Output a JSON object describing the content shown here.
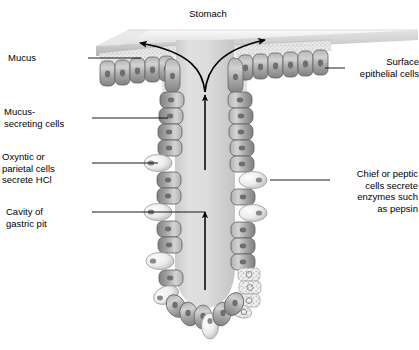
{
  "figure": {
    "name": "gastric-pit-cross-section",
    "title": "Stomach",
    "background_color": "#ffffff",
    "ink_color": "#000000"
  },
  "labels": {
    "stomach": "Stomach",
    "mucus": "Mucus",
    "mucus_secreting_cells": "Mucus-\nsecreting cells",
    "oxyntic_cells": "Oxyntic or\nparietal cells\nsecrete HCl",
    "cavity_of_gastric_pit": "Cavity of\ngastric pit",
    "surface_epithelial_cells": "Surface\nepithelial cells",
    "chief_cells": "Chief or peptic\ncells secrete\nenzymes such\nas pepsin"
  },
  "colors": {
    "cell_fill_light": "#c9c9c9",
    "cell_fill_dark": "#8e8e8e",
    "cell_outline": "#5c5c5c",
    "nucleus": "#6a6a6a",
    "lumen_fill": "#d8d8d8",
    "mucus_fill": "#e2e2e2",
    "surface_slab": "#cfcfcf",
    "parietal_cell_fill": "#f2f2f2",
    "chief_cell_fill": "#ededed",
    "leader_line": "#000000",
    "arrow": "#000000"
  },
  "structures": [
    {
      "name": "stomach-lumen-surface",
      "description": "shaded slab representing stomach lining surface"
    },
    {
      "name": "mucus-layer",
      "description": "stippled pale band overlying surface epithelium"
    },
    {
      "name": "surface-epithelial-cells",
      "description": "row of columnar cells along stomach surface"
    },
    {
      "name": "gastric-pit-cavity",
      "description": "central pale channel descending into gland"
    },
    {
      "name": "mucus-secreting-cells",
      "description": "columnar cells lining upper gastric pit"
    },
    {
      "name": "parietal-cells",
      "description": "large pale oval cells bulging from gland wall"
    },
    {
      "name": "chief-cells",
      "description": "granular cells clustered at gland base"
    },
    {
      "name": "mucus-flow-arrows",
      "description": "two curved arrows spreading mucus across surface"
    },
    {
      "name": "secretion-flow-arrows",
      "description": "two straight arrows directed up the pit lumen"
    }
  ],
  "arrows": [
    {
      "name": "mucus-arrow-left",
      "direction": "left-and-up",
      "type": "curved"
    },
    {
      "name": "mucus-arrow-right",
      "direction": "right-and-up",
      "type": "curved"
    },
    {
      "name": "secretion-arrow-upper",
      "direction": "up",
      "type": "straight"
    },
    {
      "name": "secretion-arrow-lower",
      "direction": "up",
      "type": "straight"
    }
  ]
}
